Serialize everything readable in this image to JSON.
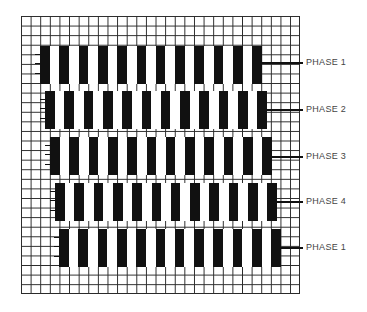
{
  "diagram": {
    "grid": {
      "columns": 29,
      "rows": 29
    },
    "bars_per_band": 12,
    "colors": {
      "bar": "#111111",
      "grid_line": "#2a2a2a",
      "label": "#444444",
      "background": "#ffffff"
    },
    "bands": [
      {
        "label": "PHASE 1",
        "x": 40,
        "y": 46,
        "label_y": 62
      },
      {
        "label": "PHASE 2",
        "x": 45,
        "y": 91,
        "label_y": 109
      },
      {
        "label": "PHASE 3",
        "x": 50,
        "y": 137,
        "label_y": 156
      },
      {
        "label": "PHASE 4",
        "x": 55,
        "y": 183,
        "label_y": 201
      },
      {
        "label": "PHASE 1",
        "x": 59,
        "y": 229,
        "label_y": 247
      }
    ]
  }
}
